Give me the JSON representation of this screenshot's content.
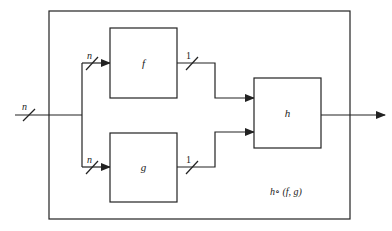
{
  "diagram": {
    "boxes": {
      "f": {
        "label": "f"
      },
      "g": {
        "label": "g"
      },
      "h": {
        "label": "h"
      }
    },
    "bus_labels": {
      "input": "n",
      "to_f": "n",
      "to_g": "n",
      "from_f": "1",
      "from_g": "1"
    },
    "composite_label": "h∘ (f, g)",
    "colors": {
      "stroke": "#222222",
      "background": "#ffffff"
    }
  }
}
